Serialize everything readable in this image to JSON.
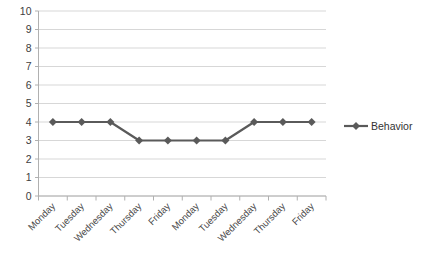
{
  "chart_data": {
    "type": "line",
    "title": "",
    "subtitle": "",
    "xlabel": "",
    "ylabel": "",
    "categories": [
      "Monday",
      "Tuesday",
      "Wednesday",
      "Thursday",
      "Friday",
      "Monday",
      "Tuesday",
      "Wednesday",
      "Thursday",
      "Friday"
    ],
    "series": [
      {
        "name": "Behavior",
        "values": [
          4,
          4,
          4,
          3,
          3,
          3,
          3,
          4,
          4,
          4
        ],
        "color": "#5a5a5a",
        "marker": "diamond"
      }
    ],
    "ylim": [
      0,
      10
    ],
    "ytick_labels": [
      "0",
      "1",
      "2",
      "3",
      "4",
      "5",
      "6",
      "7",
      "8",
      "9",
      "10"
    ],
    "ytick_values": [
      0,
      1,
      2,
      3,
      4,
      5,
      6,
      7,
      8,
      9,
      10
    ],
    "grid": true,
    "grid_axis": "y",
    "grid_color": "#d3d3d3",
    "axis_color": "#b0b0b0",
    "legend_position": "right",
    "legend_entries": [
      "Behavior"
    ],
    "xtick_label_rotation": -45,
    "plot_background": "#ffffff"
  }
}
